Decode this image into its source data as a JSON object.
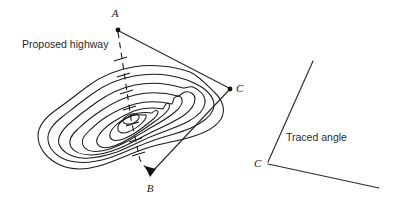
{
  "figure": {
    "background_color": "#ffffff",
    "line_color": "#1a1a1a",
    "width": 396,
    "height": 199
  },
  "labels": {
    "proposed_highway": "Proposed highway",
    "traced_angle": "Traced angle",
    "point_a": "A",
    "point_b": "B",
    "point_c_map": "C",
    "point_c_angle": "C"
  },
  "left_diagram": {
    "name": "contour-map-with-highway",
    "points": {
      "a": {
        "label": "A",
        "x": 118,
        "y": 30
      },
      "b": {
        "label": "B",
        "x": 150,
        "y": 175
      },
      "c": {
        "label": "C",
        "x": 230,
        "y": 89
      }
    },
    "profile_line": {
      "style": "dashed",
      "from": "A",
      "to": "B",
      "tick_count": 7
    },
    "sight_lines": [
      {
        "from": "A",
        "to": "C",
        "style": "solid"
      },
      {
        "from": "C",
        "to": "B",
        "style": "solid",
        "arrowhead_at": "B"
      }
    ],
    "contour_count": 8,
    "summit": {
      "x": 128,
      "y": 113
    }
  },
  "right_diagram": {
    "name": "traced-angle",
    "vertex": {
      "label": "C",
      "x": 268,
      "y": 163
    },
    "rays": [
      {
        "name": "upper-ray",
        "to_x": 313,
        "to_y": 61
      },
      {
        "name": "lower-ray",
        "to_x": 379,
        "to_y": 188
      }
    ],
    "caption": "Traced angle"
  }
}
